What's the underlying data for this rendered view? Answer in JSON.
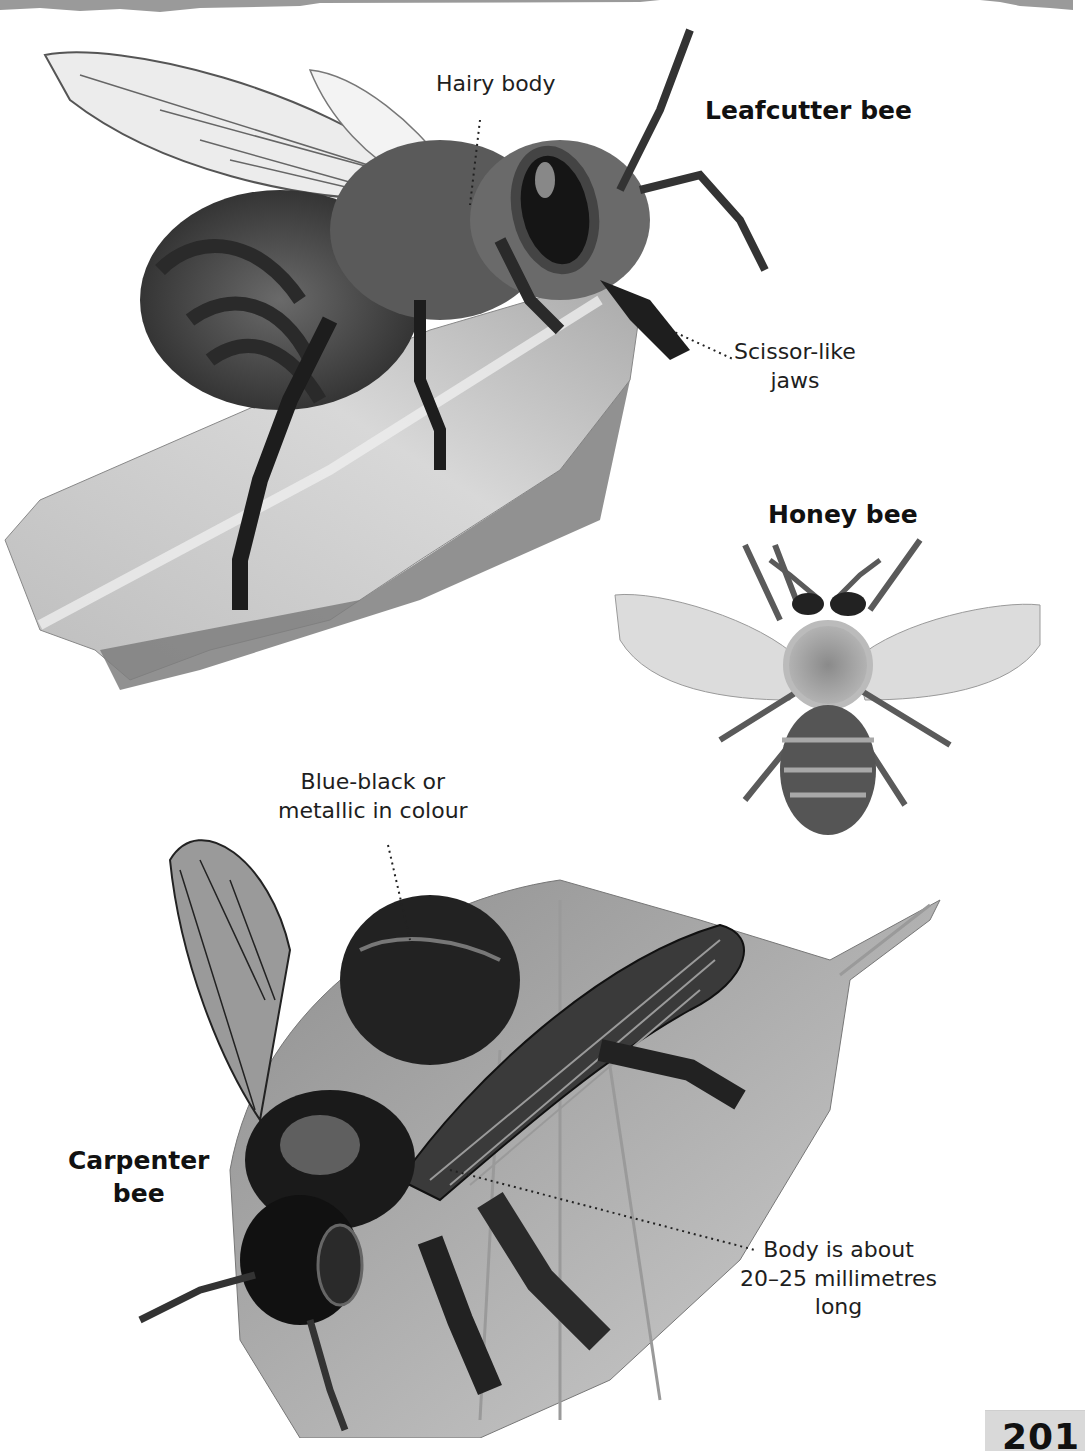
{
  "page": {
    "number": "201",
    "background": "#ffffff",
    "tab_color": "#d9d9d9"
  },
  "species": [
    {
      "name": "Leafcutter bee",
      "annotations": [
        {
          "text": "Hairy body"
        },
        {
          "text_lines": [
            "Scissor-like",
            "jaws"
          ]
        }
      ]
    },
    {
      "name": "Honey bee",
      "annotations": []
    },
    {
      "name_lines": [
        "Carpenter",
        "bee"
      ],
      "annotations": [
        {
          "text_lines": [
            "Blue-black or",
            "metallic in colour"
          ]
        },
        {
          "text_lines": [
            "Body is about",
            "20–25 millimetres",
            "long"
          ]
        }
      ]
    }
  ],
  "illustrations": {
    "leafcutter": "leafcutter-bee-on-leaf",
    "honey": "honey-bee-top-view",
    "carpenter": "carpenter-bee-on-leaf"
  }
}
